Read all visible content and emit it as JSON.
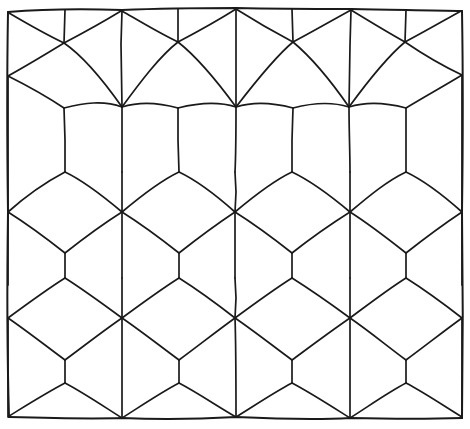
{
  "document": {
    "title": "Rhombille cube tiling",
    "description": "Hand-drawn isometric cube (rhombille) tessellation inside a hand-drawn rectangular border",
    "medium": "pen line drawing",
    "background_color": "#ffffff",
    "ink_color": "#1a1a1a",
    "canvas": {
      "width": 470,
      "height": 429
    }
  },
  "geometry": {
    "frame": {
      "label": "hand-drawn rectangular border",
      "corners": [
        {
          "x": 8,
          "y": 11
        },
        {
          "x": 462,
          "y": 10
        },
        {
          "x": 463,
          "y": 418
        },
        {
          "x": 8,
          "y": 417
        }
      ],
      "stroke_width": 2.0
    },
    "lattice": {
      "type": "rhombille",
      "star_vertex_columns": [
        8,
        122,
        235,
        350,
        462
      ],
      "star_vertex_rows": [
        107,
        212,
        318
      ],
      "y_junction_columns": [
        65,
        178,
        292,
        406
      ],
      "y_junction_rows": [
        42,
        172,
        278,
        383
      ],
      "column_period": 113,
      "row_period": 106,
      "rhombus_count_approx": 48,
      "cube_count_approx": 16
    },
    "paths": {
      "frame": "M 8,12 L 120,9 L 240,8 L 352,9 L 462,11 L 463,120 L 462,240 L 463,340 L 462,418 L 350,419 L 237,417 L 124,419 L 9,417 L 7,320 L 8,212 L 7,110 Z",
      "vertical_segments": [
        "M 65,11 L 65,42",
        "M 178,10 L 178,42",
        "M 292,10 L 292,42",
        "M 406,10 L 406,42",
        "M 122,42 L 122,107",
        "M 235,42 L 236,107",
        "M 350,42 L 349,107",
        "M 8,42 L 8,107",
        "M 462,42 L 462,107",
        "M 65,107 L 65,172",
        "M 178,107 L 179,172",
        "M 292,107 L 292,172",
        "M 406,107 L 406,172",
        "M 122,172 L 122,212",
        "M 235,172 L 236,212",
        "M 350,172 L 349,212",
        "M 8,172 L 8,212",
        "M 462,172 L 462,212",
        "M 65,212 L 65,278",
        "M 178,212 L 179,278",
        "M 292,212 L 292,278",
        "M 406,212 L 406,278",
        "M 122,278 L 122,318",
        "M 235,278 L 236,318",
        "M 350,278 L 349,318",
        "M 8,278 L 8,318",
        "M 462,278 L 462,318",
        "M 65,318 L 65,383",
        "M 178,318 L 179,383",
        "M 292,318 L 292,383",
        "M 406,318 L 406,383",
        "M 122,383 L 122,418",
        "M 235,383 L 236,417",
        "M 350,383 L 349,418"
      ]
    }
  },
  "labels": {
    "alt_text": "A hand-drawn black-and-white tessellation of isometric cubes forming a rhombille tiling, enclosed by a slightly wobbly rectangular border.",
    "shape_name": "isometric cube tiling",
    "stroke_style": "freehand pen"
  }
}
